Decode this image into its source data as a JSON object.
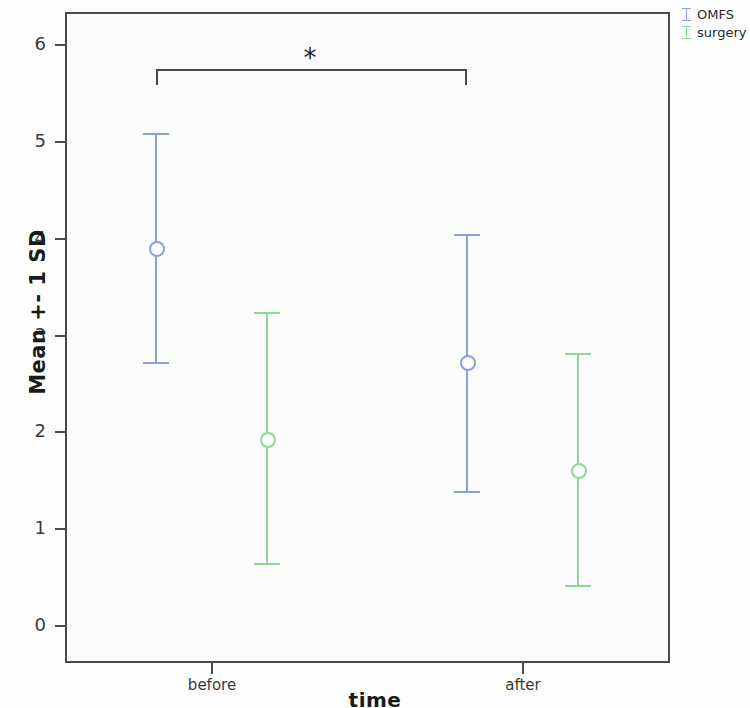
{
  "chart_data": {
    "type": "scatter",
    "title": "",
    "subtitle": "",
    "xlabel": "time",
    "ylabel": "Mean +- 1 SD",
    "categories": [
      "before",
      "after"
    ],
    "ylim": [
      -0.35,
      6.35
    ],
    "yticks": [
      0,
      1,
      2,
      3,
      4,
      5,
      6
    ],
    "ytick_labels": [
      "0",
      "1",
      "2",
      "3",
      "4",
      "5",
      "6"
    ],
    "grid": false,
    "legend_position": "top-right",
    "error_kind": "mean +- 1 SD",
    "series": [
      {
        "name": "OMFS",
        "color": "#8f9fdc",
        "values": [
          3.89,
          2.72
        ],
        "upper": [
          5.08,
          4.04
        ],
        "lower": [
          2.72,
          1.38
        ]
      },
      {
        "name": "surgery",
        "color": "#8fd69a",
        "values": [
          1.92,
          1.6
        ],
        "upper": [
          3.23,
          2.81
        ],
        "lower": [
          0.64,
          0.41
        ]
      }
    ],
    "annotations": [
      {
        "type": "significance-bracket",
        "label": "*",
        "from": "before",
        "to": "after",
        "series": "OMFS",
        "y": 5.75
      }
    ]
  },
  "legend": {
    "items": [
      {
        "label": "OMFS",
        "color": "#8f9fdc"
      },
      {
        "label": "surgery",
        "color": "#8fd69a"
      }
    ]
  },
  "axes": {
    "y_title": "Mean +- 1 SD",
    "x_title": "time"
  }
}
